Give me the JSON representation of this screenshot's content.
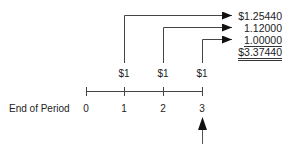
{
  "diagram": {
    "type": "future value timeline",
    "row_label": "End of Period",
    "periods": [
      "0",
      "1",
      "2",
      "3"
    ],
    "cash_flows": [
      {
        "period": "1",
        "label": "$1"
      },
      {
        "period": "2",
        "label": "$1"
      },
      {
        "period": "3",
        "label": "$1"
      }
    ],
    "compounded_values": [
      {
        "from_period": "1",
        "value": "$1.25440"
      },
      {
        "from_period": "2",
        "value": "1.12000"
      },
      {
        "from_period": "3",
        "value": "1.00000"
      }
    ],
    "total": "$3.37440",
    "marker": {
      "period": "3",
      "direction": "up-arrow"
    }
  }
}
